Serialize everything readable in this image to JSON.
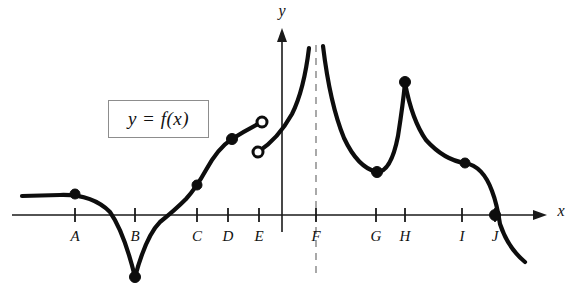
{
  "figure": {
    "type": "function-graph",
    "legend": {
      "text": "y = f(x)",
      "box": {
        "x": 108,
        "y": 100,
        "width": 101,
        "height": 38
      }
    },
    "axes": {
      "x_label": "x",
      "y_label": "y",
      "x_label_pos": {
        "x": 561,
        "y": 216
      },
      "y_label_pos": {
        "x": 282,
        "y": 16
      },
      "x_axis_y": 215,
      "y_axis_x": 282,
      "x_axis_start": 12,
      "x_axis_end": 547,
      "y_axis_top": 28,
      "y_axis_bottom": 232,
      "tick_half_height": 7
    },
    "tick_marks": [
      {
        "label": "A",
        "x": 75
      },
      {
        "label": "B",
        "x": 135
      },
      {
        "label": "C",
        "x": 197
      },
      {
        "label": "D",
        "x": 228
      },
      {
        "label": "E",
        "x": 259
      },
      {
        "label": "F",
        "x": 316
      },
      {
        "label": "G",
        "x": 376
      },
      {
        "label": "H",
        "x": 405
      },
      {
        "label": "I",
        "x": 462
      },
      {
        "label": "J",
        "x": 495
      }
    ],
    "tick_label_y": 241,
    "asymptote": {
      "x": 316,
      "y_top": 45,
      "y_bottom": 277,
      "color": "#9a9a9a"
    },
    "curve_color": "#0d0d0d",
    "curve_segments": [
      {
        "name": "left-branch-to-cusp-B",
        "path": "M 22 196 L 60 195 Q 92 194 110 212 Q 124 232 135 277"
      },
      {
        "name": "cusp-B-rise-through-C",
        "path": "M 135 277 Q 146 236 160 222 Q 175 210 186 199 Q 196 188 206 170 Q 218 148 232 139 Q 246 130 262 122"
      },
      {
        "name": "post-jump-rise-to-asymptote",
        "path": "M 258 152 Q 278 139 292 114 Q 304 90 309 48"
      },
      {
        "name": "asymptote-right-branch-to-G",
        "path": "M 323 46 Q 330 104 344 138 Q 358 168 377 172"
      },
      {
        "name": "G-to-cusp-H",
        "path": "M 377 172 Q 391 172 398 136 Q 403 104 405 83"
      },
      {
        "name": "cusp-H-descend-through-I-to-J-and-beyond",
        "path": "M 405 83 Q 412 120 426 140 Q 444 160 465 163 Q 483 166 492 191 Q 497 204 500 224 Q 508 248 525 262"
      }
    ],
    "points": [
      {
        "name": "point-A",
        "x": 75,
        "y": 194,
        "kind": "filled",
        "r": 5
      },
      {
        "name": "point-B-cusp-min",
        "x": 135,
        "y": 277,
        "kind": "filled",
        "r": 5.5
      },
      {
        "name": "point-C-inflection",
        "x": 197,
        "y": 185,
        "kind": "filled",
        "r": 5
      },
      {
        "name": "point-E-jump-upper",
        "x": 262,
        "y": 122,
        "kind": "open",
        "r": 5
      },
      {
        "name": "point-E-jump-lower",
        "x": 258,
        "y": 152,
        "kind": "open",
        "r": 5
      },
      {
        "name": "point-D-filled",
        "x": 232,
        "y": 139,
        "kind": "filled",
        "r": 5.5
      },
      {
        "name": "point-G-local-min",
        "x": 377,
        "y": 172,
        "kind": "filled",
        "r": 5.5
      },
      {
        "name": "point-H-cusp-max",
        "x": 405,
        "y": 82,
        "kind": "filled",
        "r": 5.5
      },
      {
        "name": "point-I-inflection",
        "x": 465,
        "y": 163,
        "kind": "filled",
        "r": 5
      },
      {
        "name": "point-J-x-intercept",
        "x": 495,
        "y": 215,
        "kind": "filled",
        "r": 5.5
      }
    ]
  },
  "chart_data": {
    "type": "line",
    "title": "y = f(x)",
    "xlabel": "x",
    "ylabel": "y",
    "grid": false,
    "legend": "y = f(x)",
    "categories": [
      "A",
      "B",
      "C",
      "D",
      "E",
      "F",
      "G",
      "H",
      "I",
      "J"
    ],
    "annotations": [
      "A: smooth point on flat left portion, f'(A) = 0 (horizontal tangent), f(A) > 0",
      "B: sharp cusp / corner minimum below the x-axis, derivative undefined",
      "C: inflection point on the rising branch near the x-axis",
      "D: point on the rising concave-down branch above the axis",
      "E: jump discontinuity, two open circles (left limit above right limit)",
      "F: vertical asymptote, f -> +infinity from both sides (dashed line)",
      "G: smooth local minimum above the x-axis",
      "H: sharp cusp / corner maximum, derivative undefined",
      "I: inflection point on the descending branch",
      "J: x-intercept where the curve crosses the axis going downward"
    ],
    "features": [
      {
        "label": "A",
        "x": 75,
        "feature": "horizontal tangent"
      },
      {
        "label": "B",
        "x": 135,
        "feature": "cusp minimum"
      },
      {
        "label": "C",
        "x": 197,
        "feature": "inflection"
      },
      {
        "label": "D",
        "x": 228,
        "feature": "increasing"
      },
      {
        "label": "E",
        "x": 259,
        "feature": "jump discontinuity"
      },
      {
        "label": "F",
        "x": 316,
        "feature": "vertical asymptote"
      },
      {
        "label": "G",
        "x": 376,
        "feature": "local minimum"
      },
      {
        "label": "H",
        "x": 405,
        "feature": "cusp maximum"
      },
      {
        "label": "I",
        "x": 462,
        "feature": "inflection"
      },
      {
        "label": "J",
        "x": 495,
        "feature": "x-intercept"
      }
    ]
  }
}
